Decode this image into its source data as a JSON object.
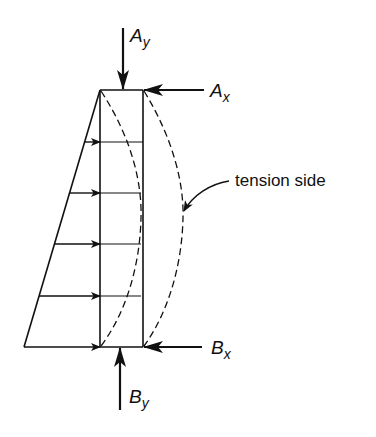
{
  "diagram": {
    "type": "structural free-body diagram (propped column under triangular lateral load)",
    "colors": {
      "background": "#ffffff",
      "ink": "#111111"
    },
    "member": {
      "left_x": 100,
      "right_x": 143,
      "top_y": 90,
      "bottom_y": 347
    },
    "load_triangle": {
      "apex": [
        100,
        90
      ],
      "base_left": [
        24,
        347
      ],
      "load_arrow_ys": [
        142,
        193,
        244,
        296,
        347
      ],
      "load_arrow_count": 5
    },
    "deflected_shapes": {
      "style": "dashed",
      "inner_curve_peak_x": 141,
      "outer_curve_peak_x": 183,
      "peak_y": 218
    },
    "reactions": [
      {
        "id": "Ay",
        "base": "A",
        "subscript": "y",
        "direction": "down",
        "location": "top"
      },
      {
        "id": "Ax",
        "base": "A",
        "subscript": "x",
        "direction": "left",
        "location": "top-right"
      },
      {
        "id": "Bx",
        "base": "B",
        "subscript": "x",
        "direction": "left",
        "location": "bottom-right"
      },
      {
        "id": "By",
        "base": "B",
        "subscript": "y",
        "direction": "up",
        "location": "bottom"
      }
    ],
    "annotation": {
      "text": "tension side",
      "points_to": "outer dashed deflected curve"
    }
  }
}
